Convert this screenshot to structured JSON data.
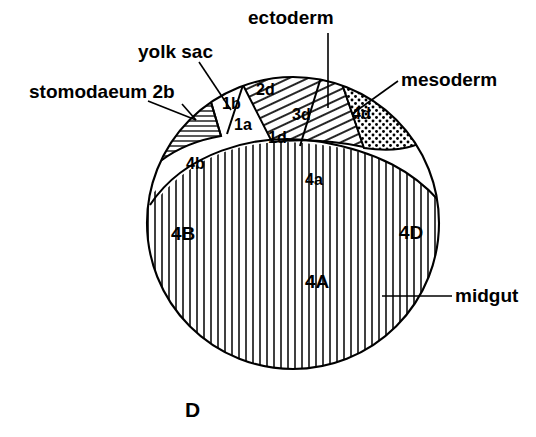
{
  "figure": {
    "panel_letter": "D",
    "background_color": "#ffffff",
    "ink_color": "#000000",
    "width": 536,
    "height": 437
  },
  "callouts": [
    {
      "id": "ectoderm",
      "label": "ectoderm",
      "x": 248,
      "y": 24,
      "anchor": "start"
    },
    {
      "id": "yolk-sac",
      "label": "yolk sac",
      "x": 138,
      "y": 58,
      "anchor": "start"
    },
    {
      "id": "stomodaeum",
      "label": "stomodaeum 2b",
      "x": 29,
      "y": 98,
      "anchor": "start"
    },
    {
      "id": "mesoderm",
      "label": "mesoderm",
      "x": 401,
      "y": 86,
      "anchor": "start"
    },
    {
      "id": "midgut",
      "label": "midgut",
      "x": 455,
      "y": 302,
      "anchor": "start"
    }
  ],
  "cell_labels": [
    {
      "id": "1b",
      "label": "1b",
      "x": 222,
      "y": 109,
      "size": "sm"
    },
    {
      "id": "2d",
      "label": "2d",
      "x": 256,
      "y": 95,
      "size": "sm"
    },
    {
      "id": "1a",
      "label": "1a",
      "x": 234,
      "y": 130,
      "size": "sm"
    },
    {
      "id": "3d",
      "label": "3d",
      "x": 292,
      "y": 120,
      "size": "sm"
    },
    {
      "id": "1d",
      "label": "1d",
      "x": 268,
      "y": 143,
      "size": "sm"
    },
    {
      "id": "4d",
      "label": "4d",
      "x": 352,
      "y": 119,
      "size": "sm"
    },
    {
      "id": "4b",
      "label": "4b",
      "x": 186,
      "y": 169,
      "size": "sm"
    },
    {
      "id": "4a",
      "label": "4a",
      "x": 305,
      "y": 185,
      "size": "sm"
    },
    {
      "id": "4B",
      "label": "4B",
      "x": 171,
      "y": 240,
      "size": "lg"
    },
    {
      "id": "4D",
      "label": "4D",
      "x": 399,
      "y": 239,
      "size": "lg"
    },
    {
      "id": "4A",
      "label": "4A",
      "x": 305,
      "y": 288,
      "size": "lg"
    }
  ],
  "regions": [
    {
      "id": "stomodaeum-2b",
      "pattern": "horizontal-hatch",
      "description": "stomodaeum 2b wedge"
    },
    {
      "id": "yolk-sac-1b-1a-1d",
      "pattern": "none",
      "description": "yolk sac white region 1b 1a 1d"
    },
    {
      "id": "ectoderm-2d-3d",
      "pattern": "diagonal-hatch",
      "description": "ectoderm 2d 3d band"
    },
    {
      "id": "mesoderm-4d",
      "pattern": "stipple",
      "description": "mesoderm 4d stippled wedge"
    },
    {
      "id": "midgut-4A-4B-4D",
      "pattern": "vertical-hatch",
      "description": "midgut macromere mass"
    }
  ]
}
